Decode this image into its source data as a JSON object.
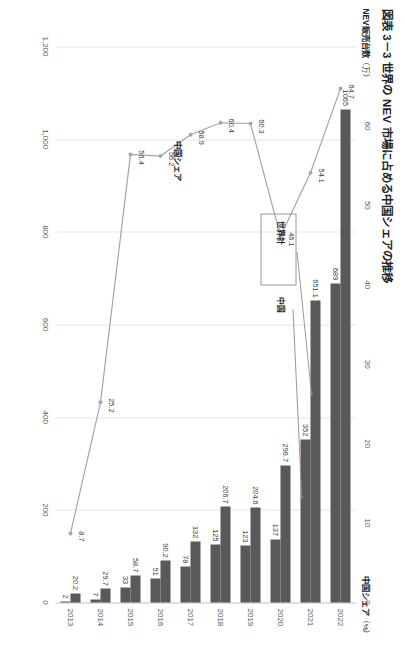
{
  "figure": {
    "title": "図表 3－3  世界の NEV 市場に占める中国シェアの推移",
    "left_axis_title": "NEV販売台数",
    "left_axis_unit": "（万）",
    "right_axis_title": "中国シェア",
    "right_axis_unit": "（%）"
  },
  "callouts": {
    "world": "世界計",
    "china": "中国"
  },
  "series_label": {
    "share": "中国シェア"
  },
  "colors": {
    "bar": "#595959",
    "line": "#a6a6a6",
    "grid": "#e6e6e6",
    "text": "#404040"
  },
  "chart_data": {
    "type": "bar",
    "title": "図表 3－3  世界の NEV 市場に占める中国シェアの推移",
    "xlabel": "",
    "ylabel": "NEV販売台数（万）",
    "y2label": "中国シェア（%）",
    "categories": [
      "2013",
      "2014",
      "2015",
      "2016",
      "2017",
      "2018",
      "2019",
      "2020",
      "2021",
      "2022"
    ],
    "ylim": [
      0,
      1200
    ],
    "y2lim": [
      0,
      70
    ],
    "yticks": [
      "0",
      "200",
      "400",
      "600",
      "800",
      "1,000",
      "1,200"
    ],
    "ytick_values": [
      0,
      200,
      400,
      600,
      800,
      1000,
      1200
    ],
    "y2ticks": [
      "0",
      "10",
      "20",
      "30",
      "40",
      "50",
      "60",
      "70"
    ],
    "y2tick_values": [
      0,
      10,
      20,
      30,
      40,
      50,
      60,
      70
    ],
    "grid": true,
    "legend": "annotated-callouts",
    "series": [
      {
        "name": "世界計",
        "kind": "bar",
        "axis": "left",
        "values": [
          20.2,
          29.7,
          58.7,
          90.2,
          132,
          206.7,
          204.6,
          296.7,
          651.1,
          1065
        ],
        "labels": [
          "20.2",
          "29.7",
          "58.7",
          "90.2",
          "132",
          "206.7",
          "204.6",
          "296.7",
          "651.1",
          "1065"
        ]
      },
      {
        "name": "中国",
        "kind": "bar",
        "axis": "left",
        "values": [
          2,
          7,
          33,
          51,
          78,
          125,
          123,
          137,
          352,
          689
        ],
        "labels": [
          "2",
          "7",
          "33",
          "51",
          "78",
          "125",
          "123",
          "137",
          "352",
          "689"
        ]
      },
      {
        "name": "中国シェア",
        "kind": "line",
        "axis": "right",
        "values": [
          8.7,
          25.2,
          56.4,
          56.2,
          58.9,
          60.4,
          60.3,
          46.1,
          54.1,
          64.7
        ],
        "labels": [
          "8.7",
          "25.2",
          "56.4",
          "56.2",
          "58.9",
          "60.4",
          "60.3",
          "46.1",
          "54.1",
          "64.7"
        ]
      }
    ]
  }
}
